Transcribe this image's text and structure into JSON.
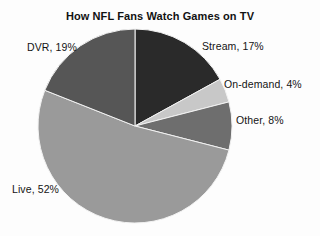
{
  "chart": {
    "title": "How NFL Fans Watch Games on TV",
    "background_color": "#fdfdfd",
    "text_color": "#141414"
  },
  "labels": {
    "stream": "Stream, 17%",
    "ondemand": "On-demand, 4%",
    "other": "Other, 8%",
    "live": "Live, 52%",
    "dvr": "DVR, 19%"
  },
  "chart_data": {
    "type": "pie",
    "title": "How NFL Fans Watch Games on TV",
    "xlabel": "",
    "ylabel": "",
    "legend": "none",
    "grid": false,
    "start_angle_deg": 90,
    "direction": "clockwise",
    "center": [
      135,
      126
    ],
    "radius": 97,
    "categories": [
      "Stream",
      "On-demand",
      "Other",
      "Live",
      "DVR"
    ],
    "values": [
      17,
      4,
      8,
      52,
      19
    ],
    "units": "percent",
    "total": 100,
    "slices": [
      {
        "name": "Stream",
        "value": 17,
        "label": "Stream, 17%",
        "color": "#2a2a2a",
        "label_position": "right-top"
      },
      {
        "name": "On-demand",
        "value": 4,
        "label": "On-demand, 4%",
        "color": "#c8c8c8",
        "label_position": "right-upper"
      },
      {
        "name": "Other",
        "value": 8,
        "label": "Other, 8%",
        "color": "#6e6e6e",
        "label_position": "right-middle"
      },
      {
        "name": "Live",
        "value": 52,
        "label": "Live, 52%",
        "color": "#9a9a9a",
        "label_position": "left-bottom"
      },
      {
        "name": "DVR",
        "value": 19,
        "label": "DVR, 19%",
        "color": "#565656",
        "label_position": "left-top"
      }
    ]
  }
}
